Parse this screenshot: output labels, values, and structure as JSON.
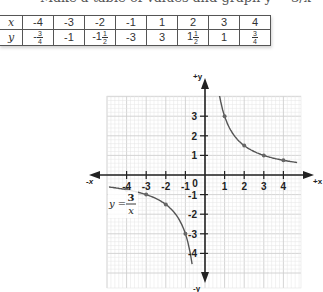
{
  "caption": "Make a table of values and graph y = 3/x",
  "table": {
    "row_labels": [
      "x",
      "y"
    ],
    "x": [
      "-4",
      "-3",
      "-2",
      "-1",
      "1",
      "2",
      "3",
      "4"
    ],
    "y": [
      {
        "whole": "-",
        "num": "3",
        "den": "4"
      },
      {
        "text": "-1"
      },
      {
        "whole": "-1",
        "num": "1",
        "den": "2"
      },
      {
        "text": "-3"
      },
      {
        "text": "3"
      },
      {
        "whole": "1",
        "num": "1",
        "den": "2"
      },
      {
        "text": "1"
      },
      {
        "whole": "",
        "num": "3",
        "den": "4"
      }
    ]
  },
  "graph": {
    "axis_labels": {
      "pos_x": "+x",
      "neg_x": "-x",
      "pos_y": "+y",
      "neg_y": "-y"
    },
    "x_ticks": [
      "-4",
      "-3",
      "-2",
      "-1",
      "0",
      "1",
      "2",
      "3",
      "4"
    ],
    "y_ticks": [
      "3",
      "2",
      "1",
      "-1",
      "-2",
      "-3",
      "-4"
    ],
    "equation": {
      "lhs": "y =",
      "num": "3",
      "den": "x"
    },
    "points": [
      [
        -4,
        -0.75
      ],
      [
        -3,
        -1
      ],
      [
        -2,
        -1.5
      ],
      [
        -1,
        -3
      ],
      [
        1,
        3
      ],
      [
        2,
        1.5
      ],
      [
        3,
        1
      ],
      [
        4,
        0.75
      ]
    ],
    "colors": {
      "grid_minor": "#e4e4e4",
      "grid_major": "#cfcfcf",
      "axis": "#222222",
      "curve": "#555555",
      "point": "#666666"
    }
  },
  "chart_data": {
    "type": "line",
    "title": "y = 3/x",
    "xlabel": "x",
    "ylabel": "y",
    "xlim": [
      -5,
      5
    ],
    "ylim": [
      -5.5,
      4
    ],
    "grid": true,
    "series": [
      {
        "name": "y = 3/x (x<0)",
        "x": [
          -4.8,
          -4,
          -3,
          -2,
          -1,
          -0.75,
          -0.65
        ],
        "y": [
          -0.625,
          -0.75,
          -1,
          -1.5,
          -3,
          -4,
          -4.6
        ]
      },
      {
        "name": "y = 3/x (x>0)",
        "x": [
          0.7,
          1,
          2,
          3,
          4,
          4.6
        ],
        "y": [
          4.3,
          3,
          1.5,
          1,
          0.75,
          0.65
        ]
      }
    ],
    "marked_points": [
      [
        -4,
        -0.75
      ],
      [
        -3,
        -1
      ],
      [
        -2,
        -1.5
      ],
      [
        -1,
        -3
      ],
      [
        1,
        3
      ],
      [
        2,
        1.5
      ],
      [
        3,
        1
      ],
      [
        4,
        0.75
      ]
    ]
  }
}
